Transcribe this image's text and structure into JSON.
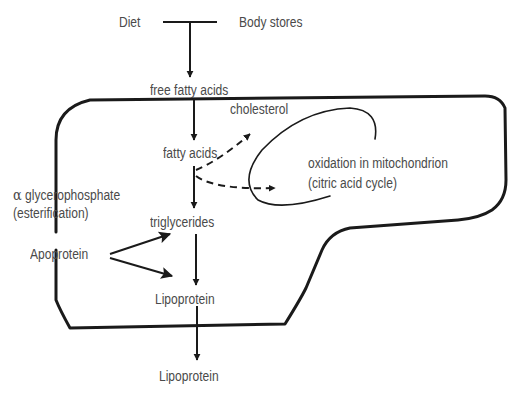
{
  "diagram": {
    "type": "metabolic-pathway",
    "sources": {
      "diet": "Diet",
      "body_stores": "Body stores"
    },
    "nodes": {
      "free_fatty_acids": "free fatty acids",
      "cholesterol": "cholesterol",
      "fatty_acids": "fatty acids",
      "oxidation_line1": "oxidation in mitochondrion",
      "oxidation_line2": "(citric acid cycle)",
      "glycerophosphate_symbol": "α",
      "glycerophosphate_line1": " glycerophosphate",
      "glycerophosphate_line2": "(esterification)",
      "triglycerides": "triglycerides",
      "apoprotein": "Apoprotein",
      "lipoprotein_inside": "Lipoprotein",
      "lipoprotein_outside": "Lipoprotein"
    },
    "edges": [
      {
        "from": "Diet + Body stores",
        "to": "free fatty acids",
        "style": "solid"
      },
      {
        "from": "free fatty acids",
        "to": "fatty acids",
        "style": "solid"
      },
      {
        "from": "fatty acids",
        "to": "cholesterol",
        "style": "dashed"
      },
      {
        "from": "fatty acids",
        "to": "oxidation in mitochondrion",
        "style": "dashed"
      },
      {
        "from": "fatty acids",
        "to": "triglycerides",
        "style": "solid"
      },
      {
        "from": "Apoprotein",
        "to": "triglycerides",
        "style": "solid"
      },
      {
        "from": "Apoprotein",
        "to": "Lipoprotein",
        "style": "solid"
      },
      {
        "from": "triglycerides",
        "to": "Lipoprotein",
        "style": "solid"
      },
      {
        "from": "Lipoprotein",
        "to": "Lipoprotein (exported)",
        "style": "solid"
      }
    ],
    "colors": {
      "line": "#1a1a1a",
      "text": "#4a4a4a",
      "background": "#ffffff"
    }
  }
}
